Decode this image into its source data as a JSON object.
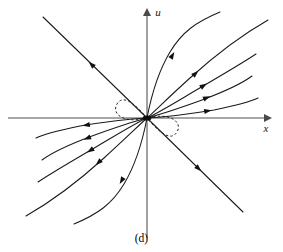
{
  "figure": {
    "caption": "(d)",
    "axes": {
      "horizontal_label": "x",
      "vertical_label": "u",
      "origin_px": [
        147,
        118
      ],
      "x_axis_from_px": [
        8,
        118
      ],
      "x_axis_to_px": [
        268,
        118
      ],
      "u_axis_from_px": [
        147,
        238
      ],
      "u_axis_to_px": [
        147,
        12
      ]
    },
    "colors": {
      "axis": "#8a8a8a",
      "trajectory": "#1a1a1a",
      "background": "#ffffff",
      "label": "#141414"
    },
    "equilibrium": {
      "name": "origin-node",
      "type": "unstable node",
      "position_px": [
        147,
        118
      ]
    }
  },
  "chart_data": {
    "type": "line",
    "title": "",
    "subtitle": "",
    "xlabel": "x",
    "ylabel": "u",
    "legend": [],
    "grid": false,
    "plot_kind": "phase-portrait",
    "xlim": [
      -8,
      268
    ],
    "ylim": [
      238,
      12
    ],
    "arrow_direction": "outward from origin",
    "trajectories": [
      {
        "name": "straight-upper-left",
        "style": "solid",
        "path": "M 147 118 L 43 17",
        "arrows": [
          {
            "x": 92,
            "y": 65,
            "angle": 224
          }
        ]
      },
      {
        "name": "straight-lower-right",
        "style": "solid",
        "path": "M 147 118 L 243 212",
        "arrows": [
          {
            "x": 198,
            "y": 168,
            "angle": 44
          }
        ]
      },
      {
        "name": "curve-ur-1-steep",
        "style": "solid",
        "path": "M 147 118 C 152 92, 158 72, 170 52 C 182 32, 196 22, 220 12",
        "arrows": [
          {
            "x": 172,
            "y": 56,
            "angle": 300
          }
        ]
      },
      {
        "name": "curve-ur-2",
        "style": "solid",
        "path": "M 147 118 C 158 108, 170 96, 190 78 C 212 58, 240 36, 268 20",
        "arrows": [
          {
            "x": 195,
            "y": 74,
            "angle": 317
          }
        ]
      },
      {
        "name": "curve-ur-3",
        "style": "solid",
        "path": "M 147 118 C 160 112, 176 102, 198 89 C 222 75, 244 62, 256 54",
        "arrows": [
          {
            "x": 203,
            "y": 86,
            "angle": 327
          }
        ]
      },
      {
        "name": "curve-ur-4",
        "style": "solid",
        "path": "M 147 118 C 162 114, 180 108, 202 100 C 226 91, 244 82, 252 76",
        "arrows": [
          {
            "x": 206,
            "y": 98,
            "angle": 337
          }
        ]
      },
      {
        "name": "curve-ur-5-flat",
        "style": "solid",
        "path": "M 147 118 C 166 117, 190 114, 214 110 C 238 105, 252 101, 258 98",
        "arrows": [
          {
            "x": 207,
            "y": 111,
            "angle": 350
          }
        ]
      },
      {
        "name": "curve-ll-1-steep",
        "style": "solid",
        "path": "M 147 118 C 142 144, 136 164, 124 184 C 112 204, 98 214, 74 224",
        "arrows": [
          {
            "x": 122,
            "y": 180,
            "angle": 120
          }
        ]
      },
      {
        "name": "curve-ll-2",
        "style": "solid",
        "path": "M 147 118 C 136 128, 124 140, 104 158 C 82 178, 54 200, 26 216",
        "arrows": [
          {
            "x": 99,
            "y": 162,
            "angle": 137
          }
        ]
      },
      {
        "name": "curve-ll-3",
        "style": "solid",
        "path": "M 147 118 C 134 124, 118 134, 96 147 C 72 161, 50 174, 38 182",
        "arrows": [
          {
            "x": 91,
            "y": 150,
            "angle": 147
          }
        ]
      },
      {
        "name": "curve-ll-4",
        "style": "solid",
        "path": "M 147 118 C 132 122, 114 128, 92 136 C 68 145, 50 154, 42 160",
        "arrows": [
          {
            "x": 88,
            "y": 138,
            "angle": 157
          }
        ]
      },
      {
        "name": "curve-ll-5-flat",
        "style": "solid",
        "path": "M 147 118 C 128 119, 104 122, 80 126 C 56 131, 42 135, 36 138",
        "arrows": [
          {
            "x": 87,
            "y": 125,
            "angle": 170
          }
        ]
      },
      {
        "name": "separatrix-loop-dashed",
        "style": "dashed",
        "path": "M 147 118 C 131 99, 122 96, 117 104 C 111 114, 124 124, 147 118 C 163 137, 172 140, 177 132 C 183 122, 170 112, 147 118 Z",
        "arrows": []
      }
    ]
  }
}
